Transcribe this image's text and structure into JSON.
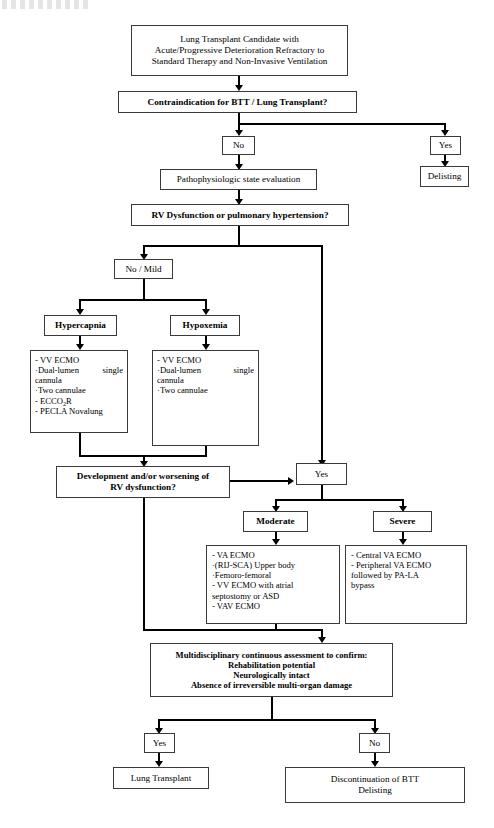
{
  "figure": {
    "type": "clinical-decision-flowchart",
    "title_partial_cut_off_at_top": "",
    "colors": {
      "line": "#000000",
      "box_border": "#3a3a3a",
      "background": "#ffffff"
    }
  },
  "nodes": {
    "start": {
      "id": "start",
      "lines": [
        "Lung Transplant Candidate with",
        "Acute/Progressive Deterioration Refractory to",
        "Standard Therapy and Non-Invasive Ventilation"
      ]
    },
    "contraindication": {
      "id": "contraindication",
      "label": "Contraindication for BTT / Lung Transplant?",
      "style": "bold-decision"
    },
    "contra_no": {
      "id": "contra-no",
      "label": "No"
    },
    "contra_yes": {
      "id": "contra-yes",
      "label": "Yes"
    },
    "delisting": {
      "id": "delisting",
      "label": "Delisting"
    },
    "patho_eval": {
      "id": "patho-eval",
      "label": "Pathophysiologic state evaluation"
    },
    "rv_decision": {
      "id": "rv-decision",
      "label": "RV Dysfunction or pulmonary hypertension?",
      "style": "bold-decision"
    },
    "no_mild": {
      "id": "no-mild",
      "label": "No / Mild"
    },
    "hypercapnia": {
      "id": "hypercapnia",
      "label": "Hypercapnia",
      "style": "bold"
    },
    "hypoxemia": {
      "id": "hypoxemia",
      "label": "Hypoxemia",
      "style": "bold"
    },
    "hypercapnia_tx": {
      "id": "hypercapnia-treatments",
      "items": [
        {
          "bullet": "-",
          "text": "VV ECMO"
        },
        {
          "bullet": "·",
          "text": "Dual-lumen",
          "text_right": "single",
          "continuation": "cannula"
        },
        {
          "bullet": "·",
          "text": "Two cannulae"
        },
        {
          "bullet": "-",
          "text": "ECCO",
          "subscript": "2",
          "text_after": "R"
        },
        {
          "bullet": "-",
          "text": "PECLA Novalung"
        }
      ]
    },
    "hypoxemia_tx": {
      "id": "hypoxemia-treatments",
      "items": [
        {
          "bullet": "-",
          "text": "VV ECMO"
        },
        {
          "bullet": "·",
          "text": "Dual-lumen",
          "text_right": "single",
          "continuation": "cannula"
        },
        {
          "bullet": "·",
          "text": "Two cannulae"
        }
      ]
    },
    "development": {
      "id": "development-worsening",
      "lines": [
        "Development and/or worsening of",
        "RV dysfunction?"
      ],
      "style": "bold-decision"
    },
    "dev_yes": {
      "id": "development-yes",
      "label": "Yes"
    },
    "moderate": {
      "id": "moderate",
      "label": "Moderate",
      "style": "bold"
    },
    "severe": {
      "id": "severe",
      "label": "Severe",
      "style": "bold"
    },
    "moderate_tx": {
      "id": "moderate-treatments",
      "items": [
        "- VA ECMO",
        "·(RIJ-SCA) Upper body",
        "·Femoro-femoral",
        "- VV ECMO with atrial",
        "septostomy or ASD",
        "- VAV ECMO"
      ]
    },
    "severe_tx": {
      "id": "severe-treatments",
      "items": [
        "- Central VA ECMO",
        "- Peripheral VA ECMO",
        "followed by PA-LA",
        "bypass"
      ]
    },
    "assessment": {
      "id": "multidisciplinary-assessment",
      "lines": [
        "Multidisciplinary continuous assessment to confirm:",
        "Rehabilitation potential",
        "Neurologically intact",
        "Absence of irreversible multi-organ damage"
      ],
      "style": "bold"
    },
    "final_yes": {
      "id": "final-yes",
      "label": "Yes"
    },
    "final_no": {
      "id": "final-no",
      "label": "No"
    },
    "lung_transplant": {
      "id": "lung-transplant",
      "label": "Lung Transplant"
    },
    "discontinuation": {
      "id": "discontinuation",
      "lines": [
        "Discontinuation of BTT",
        "Delisting"
      ]
    }
  },
  "edges": [
    {
      "from": "start",
      "to": "contraindication",
      "label": ""
    },
    {
      "from": "contraindication",
      "to": "contra_no",
      "label": "No"
    },
    {
      "from": "contraindication",
      "to": "contra_yes",
      "label": "Yes"
    },
    {
      "from": "contra_yes",
      "to": "delisting",
      "label": ""
    },
    {
      "from": "contra_no",
      "to": "patho_eval",
      "label": ""
    },
    {
      "from": "patho_eval",
      "to": "rv_decision",
      "label": ""
    },
    {
      "from": "rv_decision",
      "to": "no_mild",
      "label": "No / Mild"
    },
    {
      "from": "rv_decision",
      "to": "dev_yes",
      "label": "Yes"
    },
    {
      "from": "no_mild",
      "to": "hypercapnia",
      "label": ""
    },
    {
      "from": "no_mild",
      "to": "hypoxemia",
      "label": ""
    },
    {
      "from": "hypercapnia",
      "to": "hypercapnia_tx",
      "label": ""
    },
    {
      "from": "hypoxemia",
      "to": "hypoxemia_tx",
      "label": ""
    },
    {
      "from": "hypercapnia_tx",
      "to": "development",
      "label": ""
    },
    {
      "from": "hypoxemia_tx",
      "to": "development",
      "label": ""
    },
    {
      "from": "development",
      "to": "dev_yes",
      "label": "Yes"
    },
    {
      "from": "development",
      "to": "assessment",
      "label": ""
    },
    {
      "from": "dev_yes",
      "to": "moderate",
      "label": ""
    },
    {
      "from": "dev_yes",
      "to": "severe",
      "label": ""
    },
    {
      "from": "moderate",
      "to": "moderate_tx",
      "label": ""
    },
    {
      "from": "severe",
      "to": "severe_tx",
      "label": ""
    },
    {
      "from": "moderate_tx",
      "to": "assessment",
      "label": ""
    },
    {
      "from": "assessment",
      "to": "final_yes",
      "label": "Yes"
    },
    {
      "from": "assessment",
      "to": "final_no",
      "label": "No"
    },
    {
      "from": "final_yes",
      "to": "lung_transplant",
      "label": ""
    },
    {
      "from": "final_no",
      "to": "discontinuation",
      "label": ""
    }
  ]
}
